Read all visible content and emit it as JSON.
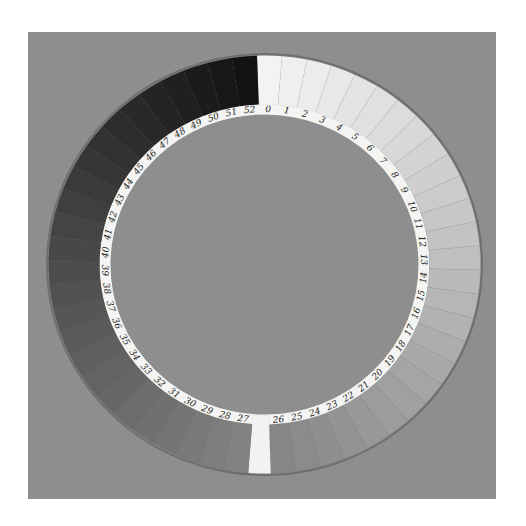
{
  "image": {
    "subject": "cyanometer",
    "description": "Circular gray-scale ring of numbered paper swatches on a gray board",
    "board_color": "#8e8e8e",
    "background_color": "#ffffff",
    "label_band_color": "#f4f4f2",
    "gap_color": "#f2f2f0",
    "segment_count": 53,
    "labels": [
      "0",
      "1",
      "2",
      "3",
      "4",
      "5",
      "6",
      "7",
      "8",
      "9",
      "10",
      "11",
      "12",
      "13",
      "14",
      "15",
      "16",
      "17",
      "18",
      "19",
      "20",
      "21",
      "22",
      "23",
      "24",
      "25",
      "26",
      "27",
      "28",
      "29",
      "30",
      "31",
      "32",
      "33",
      "34",
      "35",
      "36",
      "37",
      "38",
      "39",
      "40",
      "41",
      "42",
      "43",
      "44",
      "45",
      "46",
      "47",
      "48",
      "49",
      "50",
      "51",
      "52"
    ],
    "tone_start": "#f3f3f1",
    "tone_end": "#141414"
  }
}
